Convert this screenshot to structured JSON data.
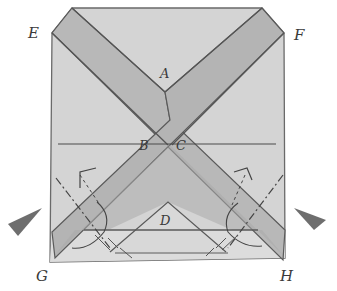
{
  "diagram": {
    "type": "folding-instruction",
    "colors": {
      "paper": "#d2d2d2",
      "strip": "#b4b4b4",
      "overlap": "#a8a8a8",
      "line": "#5a5a5a",
      "arrow": "#707070",
      "background": "#ffffff"
    },
    "labels": {
      "E": "E",
      "F": "F",
      "A": "A",
      "B": "B",
      "C": "C",
      "D": "D",
      "G": "G",
      "H": "H"
    },
    "markers": {
      "left_arrow": "push-in arrow pointing right",
      "right_arrow": "push-in arrow pointing left"
    }
  }
}
